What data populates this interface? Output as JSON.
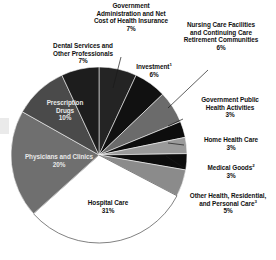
{
  "chart_data": {
    "type": "pie",
    "title": "",
    "subtitle": "",
    "xlabel": "",
    "ylabel": "",
    "legend_position": "callout-labels",
    "grid": false,
    "units": "percent",
    "total": 100,
    "categories": [
      "Hospital Care",
      "Physicians and Clinics",
      "Prescription Drugs",
      "Dental Services and Other Professionals",
      "Government Administration and Net Cost of Health Insurance",
      "Investment",
      "Nursing Care Facilities and Continuing Care Retirement Communities",
      "Government Public Health Activities",
      "Home Health Care",
      "Medical Goods",
      "Other Health, Residential, and Personal Care"
    ],
    "values": [
      31,
      20,
      10,
      7,
      7,
      6,
      6,
      3,
      3,
      3,
      5
    ],
    "slices": [
      {
        "id": "hospital-care",
        "label": "Hospital Care",
        "value": 31,
        "value_text": "31%",
        "color": "#ffffff",
        "label_placement": "inside",
        "label_tone": "light"
      },
      {
        "id": "physicians-and-clinics",
        "label": "Physicians and Clinics",
        "value": 20,
        "value_text": "20%",
        "color": "#6f6f6f",
        "label_placement": "inside",
        "label_tone": "light"
      },
      {
        "id": "prescription-drugs",
        "label": "Prescription Drugs",
        "value": 10,
        "value_text": "10%",
        "color": "#4a4a4a",
        "label_placement": "inside",
        "label_tone": "light"
      },
      {
        "id": "dental-services-and-other-professionals",
        "label": "Dental Services and Other Professionals",
        "value": 7,
        "value_text": "7%",
        "color": "#1d1d1d",
        "label_placement": "outside",
        "label_tone": "dark"
      },
      {
        "id": "government-administration-and-net-cost-of-health-insurance",
        "label": "Government Administration and Net Cost of Health Insurance",
        "value": 7,
        "value_text": "7%",
        "color": "#242424",
        "label_placement": "callout",
        "label_tone": "dark"
      },
      {
        "id": "investment",
        "label": "Investment",
        "value": 6,
        "value_text": "6%",
        "color": "#111111",
        "footnote": "1",
        "label_placement": "callout",
        "label_tone": "dark"
      },
      {
        "id": "nursing-care-facilities-and-continuing-care-retirement-communities",
        "label": "Nursing Care Facilities and Continuing Care Retirement Communities",
        "value": 6,
        "value_text": "6%",
        "color": "#6b6b6b",
        "label_placement": "callout",
        "label_tone": "dark"
      },
      {
        "id": "government-public-health-activities",
        "label": "Government Public Health Activities",
        "value": 3,
        "value_text": "3%",
        "color": "#0d0d0d",
        "label_placement": "callout",
        "label_tone": "dark"
      },
      {
        "id": "home-health-care",
        "label": "Home Health Care",
        "value": 3,
        "value_text": "3%",
        "color": "#9a9a9a",
        "label_placement": "callout",
        "label_tone": "dark"
      },
      {
        "id": "medical-goods",
        "label": "Medical Goods",
        "value": 3,
        "value_text": "3%",
        "color": "#0d0d0d",
        "footnote": "2",
        "label_placement": "callout",
        "label_tone": "dark"
      },
      {
        "id": "other-health-residential-and-personal-care",
        "label": "Other Health, Residential, and Personal Care",
        "value": 5,
        "value_text": "5%",
        "color": "#8b8b8b",
        "footnote": "3",
        "label_placement": "callout",
        "label_tone": "dark"
      }
    ]
  },
  "labels": {
    "govt_admin": {
      "line1": "Government",
      "line2": "Administration and Net",
      "line3": "Cost of Health Insurance",
      "pct": "7%"
    },
    "nursing": {
      "line1": "Nursing Care Facilities",
      "line2": "and Continuing Care",
      "line3": "Retirement Communities",
      "pct": "6%"
    },
    "investment": {
      "line1": "Investment",
      "sup": "1",
      "pct": "6%"
    },
    "govt_public": {
      "line1": "Government Public",
      "line2": "Health Activities",
      "pct": "3%"
    },
    "home_health": {
      "line1": "Home Health Care",
      "pct": "3%"
    },
    "medical_goods": {
      "line1": "Medical Goods",
      "sup": "2",
      "pct": "3%"
    },
    "other_health": {
      "line1": "Other Health, Residential,",
      "line2": "and Personal Care",
      "sup": "3",
      "pct": "5%"
    },
    "dental": {
      "line1": "Dental Services and",
      "line2": "Other Professionals",
      "pct": "7%"
    },
    "rx_drugs": {
      "line1": "Prescription",
      "line2": "Drugs",
      "pct": "10%"
    },
    "physicians": {
      "line1": "Physicians and Clinics",
      "pct": "20%"
    },
    "hospital": {
      "line1": "Hospital Care",
      "pct": "31%"
    }
  }
}
